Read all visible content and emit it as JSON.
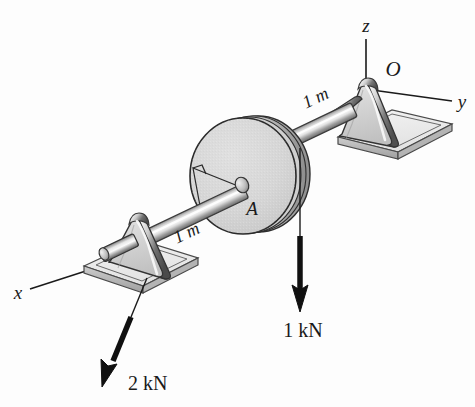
{
  "figure": {
    "background_color": "#fdfdfd",
    "ink_color": "#1a1a1a",
    "metal_light": "#f2f2f2",
    "metal_mid": "#bdbdbd",
    "metal_dark": "#6e6e6e",
    "disk_face": "#d6d6d6"
  },
  "axes": {
    "z_label": "z",
    "y_label": "y",
    "x_label": "x",
    "origin_label": "O"
  },
  "labels": {
    "pulley": "A",
    "dim_right": "1 m",
    "dim_left": "1 m"
  },
  "forces": [
    {
      "name": "belt-force-right",
      "label": "1 kN",
      "magnitude": 1,
      "unit": "kN",
      "direction": "downward (-z)"
    },
    {
      "name": "bearing-force-left",
      "label": "2 kN",
      "magnitude": 2,
      "unit": "kN",
      "direction": "down and to the left"
    }
  ],
  "annotations": {
    "right_angle_marker": "right-angle between shaft and radius"
  }
}
